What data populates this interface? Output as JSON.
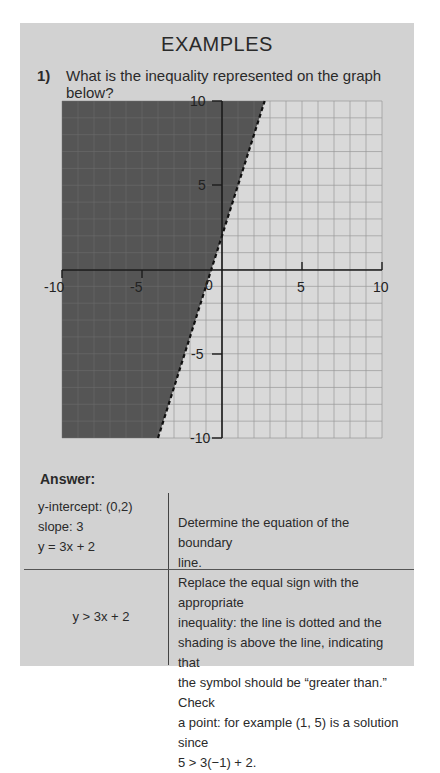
{
  "page": {
    "title": "EXAMPLES",
    "question": {
      "number": "1)",
      "text": "What is the inequality represented on the graph below?"
    },
    "answer_label": "Answer:",
    "table": {
      "rows": [
        {
          "left_lines": [
            "y-intercept: (0,2)",
            "slope: 3",
            "y = 3x + 2"
          ],
          "right_lines": [
            "Determine the equation of the boundary",
            "line."
          ]
        },
        {
          "left_lines": [
            "y > 3x + 2"
          ],
          "right_lines": [
            "Replace the equal sign with the appropriate",
            "inequality: the line is dotted and the",
            "shading is above the line, indicating that",
            "the symbol should be “greater than.” Check",
            "a point: for example (1, 5) is a solution since",
            "5 > 3(−1) + 2."
          ]
        }
      ]
    },
    "colors": {
      "panel": "#d2d2d2",
      "shading": "#555555",
      "grid": "#9a9a9a",
      "axis": "#1a1a1a"
    }
  },
  "chart_data": {
    "type": "line",
    "title": "",
    "xlabel": "",
    "ylabel": "",
    "xlim": [
      -10,
      10
    ],
    "ylim": [
      -10,
      10
    ],
    "x_ticks": [
      "-10",
      "-5",
      "0",
      "5",
      "10"
    ],
    "y_ticks": [
      "10",
      "5",
      "-5",
      "-10"
    ],
    "grid": true,
    "grid_step": 1,
    "series": [
      {
        "name": "boundary y = 3x + 2",
        "style": "dashed",
        "x": [
          -4,
          2.667
        ],
        "y": [
          -10,
          10
        ]
      }
    ],
    "shaded_region": "above the line (y > 3x + 2)",
    "annotations": []
  }
}
